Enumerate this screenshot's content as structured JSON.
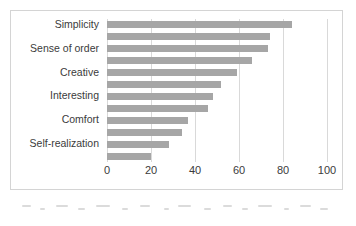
{
  "chart_data": {
    "type": "bar",
    "orientation": "horizontal",
    "title": "",
    "subtitle": "",
    "xlabel": "",
    "ylabel": "",
    "xlim": [
      0,
      100
    ],
    "xticks": [
      0,
      20,
      40,
      60,
      80,
      100
    ],
    "xtick_labels": [
      "0",
      "20",
      "40",
      "60",
      "80",
      "100"
    ],
    "grid": true,
    "gridlines_axis": "x",
    "legend": false,
    "legend_position": "none",
    "categories": [
      "Simplicity",
      "Sense of order",
      "Creative",
      "Interesting",
      "Comfort",
      "Self-realization"
    ],
    "series": [
      {
        "name": "series-1",
        "values": [
          84,
          73,
          59,
          48,
          37,
          28
        ]
      },
      {
        "name": "series-2",
        "values": [
          74,
          66,
          52,
          46,
          34,
          20
        ]
      }
    ],
    "bars_top_to_bottom": [
      84,
      74,
      73,
      66,
      59,
      52,
      48,
      46,
      37,
      34,
      28,
      20
    ],
    "bar_count": 12,
    "bar_color": "#a6a6a6",
    "gridline_color": "#d9d9d9",
    "frame_color": "#d4d4d4",
    "text_color": "#3b3b3b",
    "background": "#ffffff"
  }
}
